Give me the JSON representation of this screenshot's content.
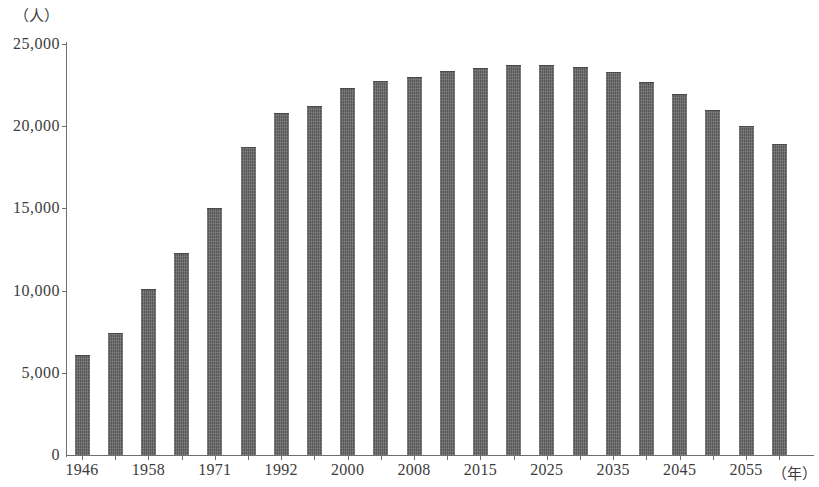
{
  "chart_data": {
    "type": "bar",
    "title": "",
    "subtitle": "",
    "xlabel": "（年）",
    "ylabel": "（人）",
    "ylim": [
      0,
      25000
    ],
    "ytick_labels": [
      "0",
      "5,000",
      "10,000",
      "15,000",
      "20,000",
      "25,000"
    ],
    "ytick_values": [
      0,
      5000,
      10000,
      15000,
      20000,
      25000
    ],
    "grid": false,
    "legend": null,
    "categories": [
      "1946",
      "1952",
      "1958",
      "1965",
      "1971",
      "1980",
      "1992",
      "1996",
      "2000",
      "2004",
      "2008",
      "2012",
      "2015",
      "2020",
      "2025",
      "2030",
      "2035",
      "2040",
      "2045",
      "2050",
      "2055",
      "2060"
    ],
    "xtick_labels_shown": [
      "1946",
      "1958",
      "1971",
      "1992",
      "2000",
      "2008",
      "2015",
      "2025",
      "2035",
      "2045",
      "2055"
    ],
    "values": [
      6100,
      7400,
      10100,
      12300,
      15000,
      18750,
      20800,
      21200,
      22300,
      22750,
      23000,
      23350,
      23550,
      23700,
      23700,
      23600,
      23300,
      22700,
      21950,
      21000,
      20000,
      18900
    ],
    "bar_color": "#575757",
    "axis_color": "#6f6f6f",
    "background_color": "#ffffff"
  },
  "axis": {
    "y_unit_label": "（人）",
    "x_unit_label": "（年）"
  }
}
